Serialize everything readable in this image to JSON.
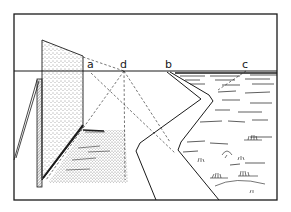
{
  "figure": {
    "type": "perspective-illustration",
    "colors": {
      "ink": "#1a1a1a",
      "paper": "#ffffff"
    },
    "labels": [
      {
        "id": "a",
        "text": "a"
      },
      {
        "id": "d",
        "text": "d"
      },
      {
        "id": "b",
        "text": "b"
      },
      {
        "id": "c",
        "text": "c"
      }
    ]
  }
}
